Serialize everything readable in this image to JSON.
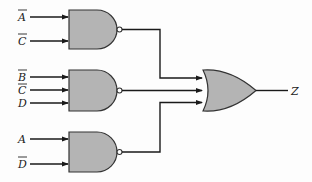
{
  "diagram": {
    "type": "logic-circuit",
    "gates": [
      {
        "id": "nand1",
        "kind": "NAND",
        "inputs": [
          "A̅",
          "C̅"
        ]
      },
      {
        "id": "nand2",
        "kind": "NAND",
        "inputs": [
          "B̅",
          "C̅",
          "D"
        ]
      },
      {
        "id": "nand3",
        "kind": "NAND",
        "inputs": [
          "A",
          "D̅"
        ]
      },
      {
        "id": "or1",
        "kind": "OR",
        "inputs": [
          "nand1",
          "nand2",
          "nand3"
        ],
        "output": "Z"
      }
    ],
    "labels": {
      "g1_in1": "A",
      "g1_in1_bar": true,
      "g1_in2": "C",
      "g1_in2_bar": true,
      "g2_in1": "B",
      "g2_in1_bar": true,
      "g2_in2": "C",
      "g2_in2_bar": true,
      "g2_in3": "D",
      "g2_in3_bar": false,
      "g3_in1": "A",
      "g3_in1_bar": false,
      "g3_in2": "D",
      "g3_in2_bar": true,
      "output": "Z"
    },
    "colors": {
      "gate_fill": "#b4b4b4",
      "wire": "#1a1a1a",
      "background": "#fdfdfd"
    }
  }
}
